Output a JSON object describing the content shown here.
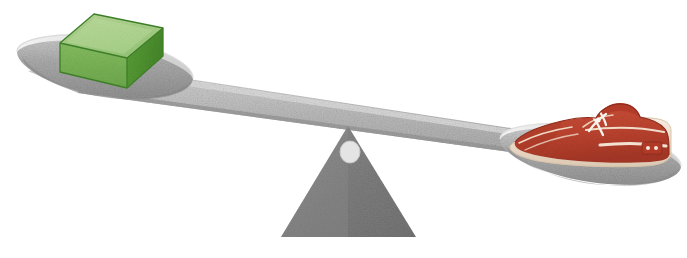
{
  "scene": {
    "title": "Balance scale comparison",
    "description": "A grey balance scale tipped to the left. The left pan, holding a green rectangular box, is lower. The right pan, holding a red boat shoe, is raised.",
    "background_color": "#ffffff",
    "width": 687,
    "height": 258,
    "state": "tipped-left",
    "heavier_side": "left"
  },
  "beam": {
    "label": "Balance beam",
    "color": "#b9b9b9",
    "edge_color": "#9e9e9e",
    "highlight_color": "#d8d8d8",
    "tilt": "left-down"
  },
  "fulcrum": {
    "label": "Fulcrum",
    "color": "#828282",
    "edge_color": "#6e6e6e",
    "pivot_hole_color": "#e2e2e2",
    "shape": "triangle"
  },
  "left_pan": {
    "label": "Left pan",
    "position": "low",
    "bowl_color": "#a9a9a9",
    "rim_color": "#e8e8e8",
    "shadow_color": "#8f8f8f",
    "item": {
      "name": "green-box",
      "label": "Green box",
      "top_color": "#a8cf84",
      "front_color": "#7ab356",
      "side_color": "#4f9433",
      "outline_color": "#3f7f28"
    }
  },
  "right_pan": {
    "label": "Right pan",
    "position": "high",
    "bowl_color": "#acacac",
    "rim_color": "#ededed",
    "shadow_color": "#939393",
    "item": {
      "name": "red-shoe",
      "label": "Red boat shoe",
      "body_color": "#bf4430",
      "body_dark_color": "#9e3322",
      "body_light_color": "#d4604a",
      "outline_color": "#8f2c1c",
      "sole_color": "#f3e6d8",
      "sole_edge_color": "#d8c4ad",
      "lace_color": "#f7f2ea",
      "stitch_color": "#f0d9c6"
    }
  }
}
